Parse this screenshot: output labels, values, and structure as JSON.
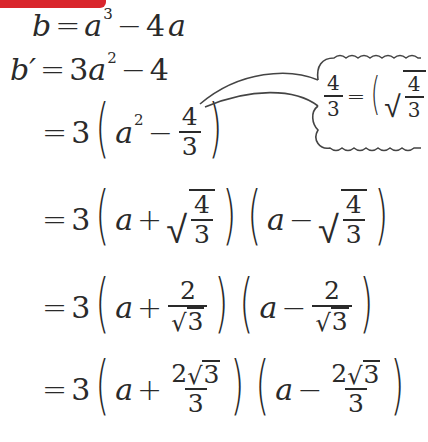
{
  "header_bar": {
    "color": "#d9262c"
  },
  "equations": {
    "line1": {
      "lhs": "b",
      "eq": "=",
      "a": "a",
      "exp": "3",
      "minus": "−",
      "coef": "4",
      "var": "a"
    },
    "line2": {
      "lhs": "b′",
      "eq": "=",
      "coef": "3",
      "a": "a",
      "exp": "2",
      "minus": "−",
      "const": "4"
    },
    "line3": {
      "eq": "=",
      "coef": "3",
      "a": "a",
      "exp": "2",
      "minus": "−",
      "num": "4",
      "den": "3"
    },
    "line4": {
      "eq": "=",
      "coef": "3",
      "a1": "a",
      "plus": "+",
      "num1": "4",
      "den1": "3",
      "a2": "a",
      "minus": "−",
      "num2": "4",
      "den2": "3"
    },
    "line5": {
      "eq": "=",
      "coef": "3",
      "a1": "a",
      "plus": "+",
      "num1": "2",
      "den1": "3",
      "a2": "a",
      "minus": "−",
      "num2": "2",
      "den2": "3"
    },
    "line6": {
      "eq": "=",
      "coef": "3",
      "a1": "a",
      "plus": "+",
      "num1_coef": "2",
      "num1_rad": "3",
      "den1": "3",
      "a2": "a",
      "minus": "−",
      "num2_coef": "2",
      "num2_rad": "3",
      "den2": "3"
    }
  },
  "callout": {
    "num": "4",
    "den": "3",
    "eq": "=",
    "inner_num": "4",
    "inner_den": "3"
  },
  "icons": {
    "radical": "√",
    "left_paren": "(",
    "right_paren": ")"
  }
}
